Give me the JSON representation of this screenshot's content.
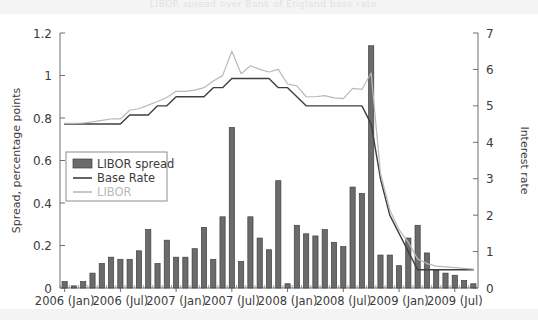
{
  "figure": {
    "background_color": "#ffffff",
    "strip_color": "#f4f4f4",
    "ghost_title": "LIBOR spread over Bank of England base rate"
  },
  "chart_data": {
    "type": "bar",
    "title": "",
    "subtitle": "",
    "xlabel": "",
    "ylabel": "Spread, percentage points",
    "y2label": "Interest rate",
    "ylim": [
      0,
      1.2
    ],
    "y2lim": [
      0,
      7
    ],
    "grid": false,
    "legend_position": "upper-left-inside",
    "y_ticks": [
      "0",
      "0.2",
      "0.4",
      "0.6",
      "0.8",
      "1",
      "1.2"
    ],
    "y_tick_values": [
      0,
      0.2,
      0.4,
      0.6,
      0.8,
      1,
      1.2
    ],
    "y2_ticks": [
      "0",
      "1",
      "2",
      "3",
      "4",
      "5",
      "6",
      "7"
    ],
    "y2_tick_values": [
      0,
      1,
      2,
      3,
      4,
      5,
      6,
      7
    ],
    "x_tick_labels": [
      "2006 (Jan)",
      "2006 (Jul)",
      "2007 (Jan)",
      "2007 (Jul)",
      "2008 (Jan)",
      "2008 (Jul)",
      "2009 (Jan)",
      "2009 (Jul)"
    ],
    "x_tick_indices": [
      0,
      6,
      12,
      18,
      24,
      30,
      36,
      42
    ],
    "categories": [
      "2006-01",
      "2006-02",
      "2006-03",
      "2006-04",
      "2006-05",
      "2006-06",
      "2006-07",
      "2006-08",
      "2006-09",
      "2006-10",
      "2006-11",
      "2006-12",
      "2007-01",
      "2007-02",
      "2007-03",
      "2007-04",
      "2007-05",
      "2007-06",
      "2007-07",
      "2007-08",
      "2007-09",
      "2007-10",
      "2007-11",
      "2007-12",
      "2008-01",
      "2008-02",
      "2008-03",
      "2008-04",
      "2008-05",
      "2008-06",
      "2008-07",
      "2008-08",
      "2008-09",
      "2008-10",
      "2008-11",
      "2008-12",
      "2009-01",
      "2009-02",
      "2009-03",
      "2009-04",
      "2009-05",
      "2009-06",
      "2009-07",
      "2009-08",
      "2009-09"
    ],
    "series": [
      {
        "name": "LIBOR spread",
        "kind": "bar",
        "axis": "left",
        "color": "#6b6b6b",
        "edge_color": "#3f3f3f",
        "values": [
          0.03,
          0.01,
          0.03,
          0.07,
          0.115,
          0.145,
          0.135,
          0.135,
          0.175,
          0.275,
          0.115,
          0.225,
          0.145,
          0.145,
          0.185,
          0.285,
          0.135,
          0.335,
          0.755,
          0.125,
          0.335,
          0.235,
          0.18,
          0.505,
          0.02,
          0.295,
          0.255,
          0.245,
          0.275,
          0.215,
          0.195,
          0.475,
          0.445,
          1.14,
          0.155,
          0.155,
          0.105,
          0.235,
          0.295,
          0.165,
          0.085,
          0.07,
          0.06,
          0.035,
          0.02
        ]
      },
      {
        "name": "Base Rate",
        "kind": "line",
        "axis": "right",
        "color": "#3f3f3f",
        "values": [
          4.5,
          4.5,
          4.5,
          4.5,
          4.5,
          4.5,
          4.5,
          4.75,
          4.75,
          4.75,
          5.0,
          5.0,
          5.25,
          5.25,
          5.25,
          5.25,
          5.5,
          5.5,
          5.75,
          5.75,
          5.75,
          5.75,
          5.75,
          5.5,
          5.5,
          5.25,
          5.0,
          5.0,
          5.0,
          5.0,
          5.0,
          5.0,
          5.0,
          4.5,
          3.0,
          2.0,
          1.5,
          1.0,
          0.5,
          0.5,
          0.5,
          0.5,
          0.5,
          0.5,
          0.5
        ]
      },
      {
        "name": "LIBOR",
        "kind": "line",
        "axis": "right",
        "color": "#b9b9b9",
        "values": [
          4.52,
          4.52,
          4.53,
          4.56,
          4.6,
          4.64,
          4.64,
          4.88,
          4.92,
          5.02,
          5.12,
          5.23,
          5.4,
          5.4,
          5.43,
          5.5,
          5.68,
          5.83,
          6.5,
          5.88,
          6.1,
          6.0,
          5.93,
          6.0,
          5.6,
          5.55,
          5.25,
          5.25,
          5.28,
          5.22,
          5.2,
          5.48,
          5.45,
          5.9,
          3.15,
          2.15,
          1.6,
          1.25,
          0.8,
          0.67,
          0.6,
          0.58,
          0.56,
          0.54,
          0.52
        ]
      }
    ],
    "legend": [
      {
        "label": "LIBOR spread",
        "marker": "bar",
        "color": "#6b6b6b"
      },
      {
        "label": "Base Rate",
        "marker": "line",
        "color": "#3f3f3f"
      },
      {
        "label": "LIBOR",
        "marker": "line",
        "color": "#b9b9b9"
      }
    ]
  }
}
